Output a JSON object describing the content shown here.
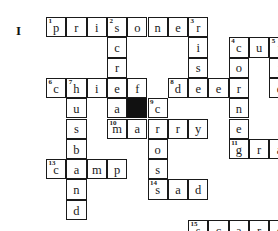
{
  "exercise": {
    "label": "I"
  },
  "grid": {
    "columns": 13,
    "rows": 10,
    "cell_size": 20.3,
    "origin_x": 46,
    "origin_y": 17,
    "border_color": "#1a1a1a",
    "block_color": "#111111",
    "cell_color": "#ffffff"
  },
  "cells": [
    {
      "r": 0,
      "c": 0,
      "letter": "p",
      "num": "1"
    },
    {
      "r": 0,
      "c": 1,
      "letter": "r",
      "num": ""
    },
    {
      "r": 0,
      "c": 2,
      "letter": "i",
      "num": ""
    },
    {
      "r": 0,
      "c": 3,
      "letter": "s",
      "num": "2"
    },
    {
      "r": 0,
      "c": 4,
      "letter": "o",
      "num": ""
    },
    {
      "r": 0,
      "c": 5,
      "letter": "n",
      "num": ""
    },
    {
      "r": 0,
      "c": 6,
      "letter": "e",
      "num": ""
    },
    {
      "r": 0,
      "c": 7,
      "letter": "r",
      "num": "3"
    },
    {
      "r": 1,
      "c": 3,
      "letter": "c",
      "num": ""
    },
    {
      "r": 1,
      "c": 7,
      "letter": "i",
      "num": ""
    },
    {
      "r": 1,
      "c": 9,
      "letter": "c",
      "num": "4"
    },
    {
      "r": 1,
      "c": 10,
      "letter": "u",
      "num": ""
    },
    {
      "r": 1,
      "c": 11,
      "letter": "t",
      "num": "5"
    },
    {
      "r": 2,
      "c": 3,
      "letter": "r",
      "num": ""
    },
    {
      "r": 2,
      "c": 7,
      "letter": "s",
      "num": ""
    },
    {
      "r": 2,
      "c": 9,
      "letter": "o",
      "num": ""
    },
    {
      "r": 2,
      "c": 11,
      "letter": "i",
      "num": ""
    },
    {
      "r": 3,
      "c": 0,
      "letter": "c",
      "num": "6"
    },
    {
      "r": 3,
      "c": 1,
      "letter": "h",
      "num": "7"
    },
    {
      "r": 3,
      "c": 2,
      "letter": "i",
      "num": ""
    },
    {
      "r": 3,
      "c": 3,
      "letter": "e",
      "num": ""
    },
    {
      "r": 3,
      "c": 4,
      "letter": "f",
      "num": ""
    },
    {
      "r": 3,
      "c": 6,
      "letter": "d",
      "num": "8"
    },
    {
      "r": 3,
      "c": 7,
      "letter": "e",
      "num": ""
    },
    {
      "r": 3,
      "c": 8,
      "letter": "e",
      "num": ""
    },
    {
      "r": 3,
      "c": 9,
      "letter": "r",
      "num": ""
    },
    {
      "r": 3,
      "c": 11,
      "letter": "e",
      "num": ""
    },
    {
      "r": 4,
      "c": 1,
      "letter": "u",
      "num": ""
    },
    {
      "r": 4,
      "c": 3,
      "letter": "a",
      "num": ""
    },
    {
      "r": 4,
      "c": 4,
      "letter": "",
      "num": "",
      "block": true
    },
    {
      "r": 4,
      "c": 5,
      "letter": "c",
      "num": "9"
    },
    {
      "r": 4,
      "c": 9,
      "letter": "n",
      "num": ""
    },
    {
      "r": 5,
      "c": 1,
      "letter": "s",
      "num": ""
    },
    {
      "r": 5,
      "c": 3,
      "letter": "m",
      "num": "10"
    },
    {
      "r": 5,
      "c": 4,
      "letter": "a",
      "num": ""
    },
    {
      "r": 5,
      "c": 5,
      "letter": "r",
      "num": ""
    },
    {
      "r": 5,
      "c": 6,
      "letter": "r",
      "num": ""
    },
    {
      "r": 5,
      "c": 7,
      "letter": "y",
      "num": ""
    },
    {
      "r": 5,
      "c": 9,
      "letter": "e",
      "num": ""
    },
    {
      "r": 6,
      "c": 1,
      "letter": "b",
      "num": ""
    },
    {
      "r": 6,
      "c": 5,
      "letter": "o",
      "num": ""
    },
    {
      "r": 6,
      "c": 9,
      "letter": "g",
      "num": "11"
    },
    {
      "r": 6,
      "c": 10,
      "letter": "r",
      "num": ""
    },
    {
      "r": 6,
      "c": 11,
      "letter": "a",
      "num": ""
    },
    {
      "r": 6,
      "c": 12,
      "letter": "b",
      "num": "12"
    },
    {
      "r": 7,
      "c": 0,
      "letter": "c",
      "num": "13"
    },
    {
      "r": 7,
      "c": 1,
      "letter": "a",
      "num": ""
    },
    {
      "r": 7,
      "c": 2,
      "letter": "m",
      "num": ""
    },
    {
      "r": 7,
      "c": 3,
      "letter": "p",
      "num": ""
    },
    {
      "r": 7,
      "c": 5,
      "letter": "s",
      "num": ""
    },
    {
      "r": 7,
      "c": 12,
      "letter": "l",
      "num": ""
    },
    {
      "r": 8,
      "c": 1,
      "letter": "n",
      "num": ""
    },
    {
      "r": 8,
      "c": 5,
      "letter": "s",
      "num": "14"
    },
    {
      "r": 8,
      "c": 6,
      "letter": "a",
      "num": ""
    },
    {
      "r": 8,
      "c": 7,
      "letter": "d",
      "num": ""
    },
    {
      "r": 8,
      "c": 12,
      "letter": "o",
      "num": ""
    },
    {
      "r": 9,
      "c": 1,
      "letter": "d",
      "num": ""
    },
    {
      "r": 9,
      "c": 12,
      "letter": "o",
      "num": ""
    },
    {
      "r": 10,
      "c": 7,
      "letter": "s",
      "num": "15"
    },
    {
      "r": 10,
      "c": 8,
      "letter": "c",
      "num": ""
    },
    {
      "r": 10,
      "c": 9,
      "letter": "a",
      "num": ""
    },
    {
      "r": 10,
      "c": 10,
      "letter": "r",
      "num": ""
    },
    {
      "r": 10,
      "c": 11,
      "letter": "e",
      "num": ""
    },
    {
      "r": 10,
      "c": 12,
      "letter": "d",
      "num": ""
    }
  ],
  "answers": {
    "across": [
      {
        "num": "1",
        "word": "prisoner"
      },
      {
        "num": "4",
        "word": "cut"
      },
      {
        "num": "6",
        "word": "chief"
      },
      {
        "num": "8",
        "word": "deer"
      },
      {
        "num": "10",
        "word": "marry"
      },
      {
        "num": "11",
        "word": "grab"
      },
      {
        "num": "13",
        "word": "camp"
      },
      {
        "num": "14",
        "word": "sad"
      },
      {
        "num": "15",
        "word": "scared"
      }
    ],
    "down": [
      {
        "num": "2",
        "word": "scream"
      },
      {
        "num": "3",
        "word": "rise"
      },
      {
        "num": "4",
        "word": "corner"
      },
      {
        "num": "5",
        "word": "tie"
      },
      {
        "num": "7",
        "word": "husband"
      },
      {
        "num": "9",
        "word": "cross"
      },
      {
        "num": "12",
        "word": "blood"
      }
    ]
  }
}
